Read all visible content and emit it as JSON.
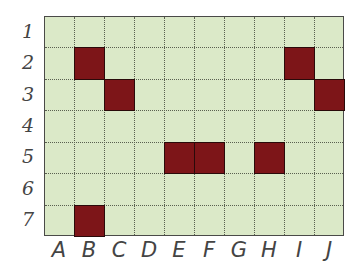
{
  "grid": {
    "columns": [
      "A",
      "B",
      "C",
      "D",
      "E",
      "F",
      "G",
      "H",
      "I",
      "J"
    ],
    "rows": [
      "1",
      "2",
      "3",
      "4",
      "5",
      "6",
      "7"
    ],
    "background_color": "#dbe9c8",
    "fill_color": "#7d1518",
    "filled_cells": [
      {
        "col": "B",
        "row": "2"
      },
      {
        "col": "I",
        "row": "2"
      },
      {
        "col": "C",
        "row": "3"
      },
      {
        "col": "J",
        "row": "3"
      },
      {
        "col": "E",
        "row": "5"
      },
      {
        "col": "F",
        "row": "5"
      },
      {
        "col": "H",
        "row": "5"
      },
      {
        "col": "B",
        "row": "7"
      }
    ]
  }
}
